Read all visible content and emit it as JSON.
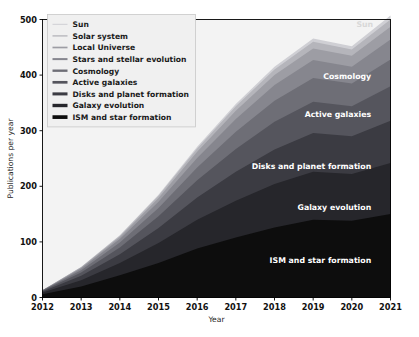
{
  "chart_data": {
    "type": "area",
    "stacked": true,
    "title": "",
    "xlabel": "Year",
    "ylabel": "Publications per year",
    "x": [
      2012,
      2013,
      2014,
      2015,
      2016,
      2017,
      2018,
      2019,
      2020,
      2021
    ],
    "xticklabels": [
      "2012",
      "2013",
      "2014",
      "2015",
      "2016",
      "2017",
      "2018",
      "2019",
      "2020",
      "2021"
    ],
    "yticks": [
      0,
      100,
      200,
      300,
      400,
      500
    ],
    "yticklabels": [
      "0",
      "100",
      "200",
      "300",
      "400",
      "500"
    ],
    "xlim": [
      2012,
      2021
    ],
    "ylim": [
      0,
      500
    ],
    "grid": false,
    "legend_position": "upper left",
    "series": [
      {
        "name": "ISM and star formation",
        "color": "#0d0d0d",
        "values": [
          6,
          20,
          40,
          62,
          88,
          108,
          126,
          140,
          138,
          150
        ]
      },
      {
        "name": "Galaxy evolution",
        "color": "#26262b",
        "values": [
          3,
          11,
          22,
          36,
          52,
          66,
          78,
          86,
          84,
          92
        ]
      },
      {
        "name": "Disks and planet formation",
        "color": "#3b3b42",
        "values": [
          2,
          8,
          16,
          27,
          40,
          52,
          62,
          70,
          68,
          76
        ]
      },
      {
        "name": "Active galaxies",
        "color": "#55555d",
        "values": [
          1,
          6,
          12,
          21,
          31,
          41,
          50,
          56,
          54,
          62
        ]
      },
      {
        "name": "Cosmology",
        "color": "#6e6e76",
        "values": [
          1,
          4,
          9,
          15,
          23,
          31,
          38,
          43,
          41,
          48
        ]
      },
      {
        "name": "Stars and stellar evolution",
        "color": "#86868e",
        "values": [
          0,
          3,
          6,
          11,
          17,
          23,
          28,
          32,
          30,
          36
        ]
      },
      {
        "name": "Local Universe",
        "color": "#9d9da4",
        "values": [
          0,
          2,
          4,
          7,
          11,
          15,
          18,
          21,
          20,
          23
        ]
      },
      {
        "name": "Solar system",
        "color": "#b5b5bb",
        "values": [
          0,
          1,
          2,
          4,
          6,
          8,
          10,
          12,
          11,
          13
        ]
      },
      {
        "name": "Sun",
        "color": "#cfcfd4",
        "values": [
          0,
          0,
          1,
          2,
          3,
          4,
          5,
          6,
          6,
          7
        ]
      }
    ],
    "legend_entries": [
      {
        "label": "Sun",
        "color": "#cfcfd4"
      },
      {
        "label": "Solar system",
        "color": "#b5b5bb"
      },
      {
        "label": "Local Universe",
        "color": "#9d9da4"
      },
      {
        "label": "Stars and stellar evolution",
        "color": "#86868e"
      },
      {
        "label": "Cosmology",
        "color": "#6e6e76"
      },
      {
        "label": "Active galaxies",
        "color": "#55555d"
      },
      {
        "label": "Disks and planet formation",
        "color": "#3b3b42"
      },
      {
        "label": "Galaxy evolution",
        "color": "#26262b"
      },
      {
        "label": "ISM and star formation",
        "color": "#0d0d0d"
      }
    ],
    "annotations": [
      {
        "text": "Sun",
        "x": 2020.55,
        "y": 486,
        "faint": true,
        "anchor": "end"
      },
      {
        "text": "Cosmology",
        "x": 2020.5,
        "y": 393,
        "faint": false,
        "anchor": "end"
      },
      {
        "text": "Active galaxies",
        "x": 2020.5,
        "y": 325,
        "faint": false,
        "anchor": "end"
      },
      {
        "text": "Disks and planet formation",
        "x": 2020.5,
        "y": 232,
        "faint": false,
        "anchor": "end"
      },
      {
        "text": "Galaxy evolution",
        "x": 2020.5,
        "y": 158,
        "faint": false,
        "anchor": "end"
      },
      {
        "text": "ISM and star formation",
        "x": 2020.5,
        "y": 62,
        "faint": false,
        "anchor": "end"
      }
    ]
  }
}
